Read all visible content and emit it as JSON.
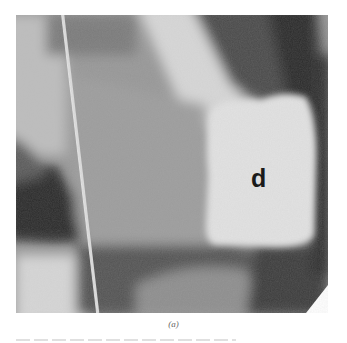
{
  "figure": {
    "label": "d",
    "caption": "(a)",
    "colors": {
      "background": "#ffffff",
      "bright_mass": "#e2e2e2",
      "dark_region": "#2e2e2e",
      "mid_tone": "#8e8e8e",
      "label": "#1a1a1a"
    }
  }
}
